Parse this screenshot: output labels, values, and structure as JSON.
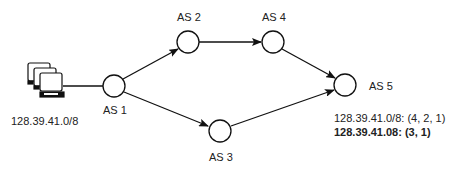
{
  "diagram": {
    "host": {
      "label": "128.39.41.0/8",
      "icon": "computer-cluster-icon"
    },
    "nodes": [
      {
        "id": "AS1",
        "label": "AS 1"
      },
      {
        "id": "AS2",
        "label": "AS 2"
      },
      {
        "id": "AS3",
        "label": "AS 3"
      },
      {
        "id": "AS4",
        "label": "AS 4"
      },
      {
        "id": "AS5",
        "label": "AS 5"
      }
    ],
    "edges": [
      {
        "from": "host",
        "to": "AS1",
        "directed": false
      },
      {
        "from": "AS1",
        "to": "AS2",
        "directed": true
      },
      {
        "from": "AS2",
        "to": "AS4",
        "directed": true
      },
      {
        "from": "AS4",
        "to": "AS5",
        "directed": true
      },
      {
        "from": "AS1",
        "to": "AS3",
        "directed": true
      },
      {
        "from": "AS3",
        "to": "AS5",
        "directed": true
      }
    ],
    "routes": [
      {
        "text": "128.39.41.0/8: (4, 2, 1)",
        "bold": false
      },
      {
        "text": "128.39.41.08: (3, 1)",
        "bold": true
      }
    ]
  }
}
